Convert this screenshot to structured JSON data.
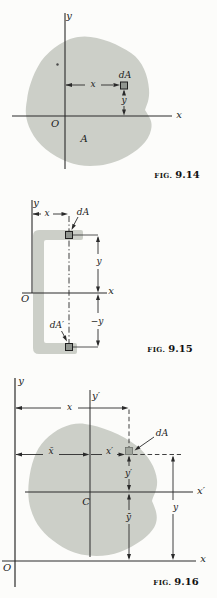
{
  "colors": {
    "area_fill": "#cccfc8",
    "line": "#2a2a2a",
    "element_fill": "#90958f",
    "element_fill_light": "#a2a79f",
    "text": "#1b1b1b",
    "background": "#fcfcfa"
  },
  "figures": {
    "fig14": {
      "caption": {
        "prefix": "FIG.",
        "number": "9.14"
      },
      "labels": {
        "y_axis": "y",
        "x_axis": "x",
        "origin": "O",
        "area": "A",
        "element": "dA",
        "dim_x": "x",
        "dim_y": "y"
      }
    },
    "fig15": {
      "caption": {
        "prefix": "FIG.",
        "number": "9.15"
      },
      "labels": {
        "y_axis": "y",
        "x_axis": "x",
        "origin": "O",
        "element_top": "dA",
        "element_bottom": "dA′",
        "dim_x": "x",
        "dim_y": "y",
        "dim_neg_y": "−y"
      }
    },
    "fig16": {
      "caption": {
        "prefix": "FIG.",
        "number": "9.16"
      },
      "labels": {
        "y_axis": "y",
        "x_axis": "x",
        "y_prime_axis": "y′",
        "x_prime_axis": "x′",
        "origin": "O",
        "centroid": "C",
        "element": "dA",
        "dim_x": "x",
        "dim_xbar": "x̄",
        "dim_x_prime": "x′",
        "dim_y_prime": "y′",
        "dim_ybar": "ȳ",
        "dim_y": "y"
      }
    }
  }
}
